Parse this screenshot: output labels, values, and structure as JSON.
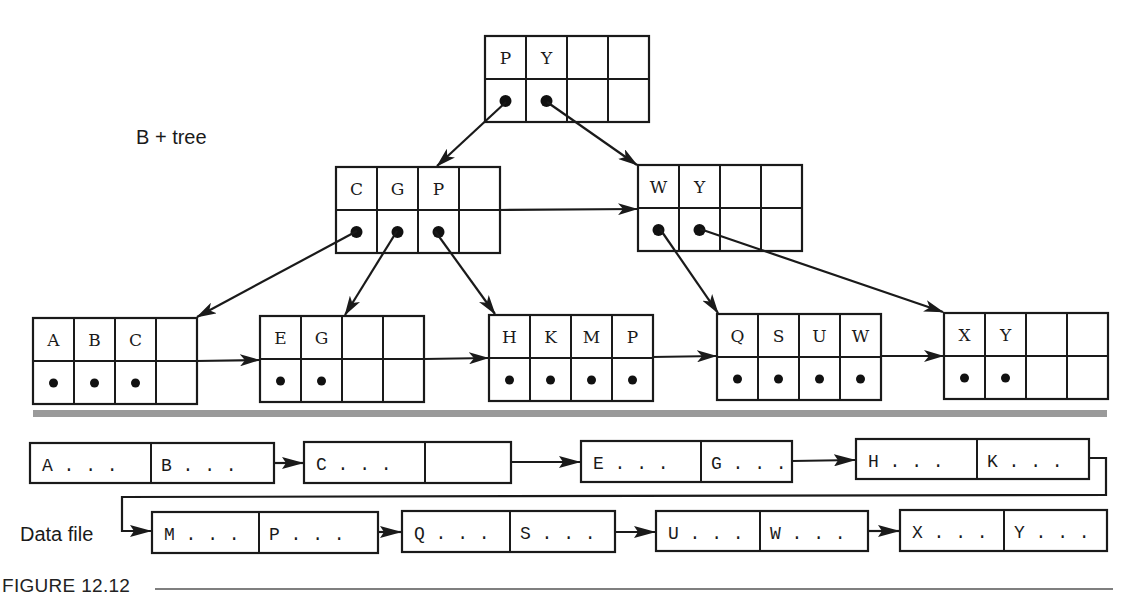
{
  "title_label": "B + tree",
  "data_file_label": "Data file",
  "caption": "FIGURE 12.12",
  "colors": {
    "ink": "#1a1a1a",
    "separator": "#9a9a9a",
    "background": "#ffffff"
  },
  "tree": {
    "order_slots": 4,
    "root": {
      "id": "root",
      "keys": [
        "P",
        "Y",
        "",
        ""
      ],
      "pointers": [
        true,
        true,
        false,
        false
      ]
    },
    "internal": [
      {
        "id": "int-cgp",
        "keys": [
          "C",
          "G",
          "P",
          ""
        ],
        "pointers": [
          true,
          true,
          true,
          false
        ]
      },
      {
        "id": "int-wy",
        "keys": [
          "W",
          "Y",
          "",
          ""
        ],
        "pointers": [
          true,
          true,
          false,
          false
        ]
      }
    ],
    "leaves": [
      {
        "id": "leaf-abc",
        "keys": [
          "A",
          "B",
          "C",
          ""
        ],
        "pointers": [
          true,
          true,
          true,
          false
        ]
      },
      {
        "id": "leaf-eg",
        "keys": [
          "E",
          "G",
          "",
          ""
        ],
        "pointers": [
          true,
          true,
          false,
          false
        ]
      },
      {
        "id": "leaf-hkmp",
        "keys": [
          "H",
          "K",
          "M",
          "P"
        ],
        "pointers": [
          true,
          true,
          true,
          true
        ]
      },
      {
        "id": "leaf-qsuw",
        "keys": [
          "Q",
          "S",
          "U",
          "W"
        ],
        "pointers": [
          true,
          true,
          true,
          true
        ]
      },
      {
        "id": "leaf-xy",
        "keys": [
          "X",
          "Y",
          "",
          ""
        ],
        "pointers": [
          true,
          true,
          false,
          false
        ]
      }
    ],
    "edges": [
      {
        "from": "root.P",
        "to": "int-cgp"
      },
      {
        "from": "root.Y",
        "to": "int-wy"
      },
      {
        "from": "int-cgp",
        "to": "int-wy",
        "type": "sibling"
      },
      {
        "from": "int-cgp.C",
        "to": "leaf-abc"
      },
      {
        "from": "int-cgp.G",
        "to": "leaf-eg"
      },
      {
        "from": "int-cgp.P",
        "to": "leaf-hkmp"
      },
      {
        "from": "int-wy.W",
        "to": "leaf-qsuw"
      },
      {
        "from": "int-wy.Y",
        "to": "leaf-xy"
      },
      {
        "from": "leaf-abc",
        "to": "leaf-eg",
        "type": "sibling"
      },
      {
        "from": "leaf-eg",
        "to": "leaf-hkmp",
        "type": "sibling"
      },
      {
        "from": "leaf-hkmp",
        "to": "leaf-qsuw",
        "type": "sibling"
      },
      {
        "from": "leaf-qsuw",
        "to": "leaf-xy",
        "type": "sibling"
      }
    ]
  },
  "data_file": {
    "blocks": [
      {
        "records": [
          "A . . .",
          "B . . ."
        ]
      },
      {
        "records": [
          "C . . .",
          ""
        ]
      },
      {
        "records": [
          "E . . .",
          "G . . ."
        ]
      },
      {
        "records": [
          "H . . .",
          "K . . ."
        ]
      },
      {
        "records": [
          "M . . .",
          "P . . ."
        ]
      },
      {
        "records": [
          "Q . . .",
          "S . . ."
        ]
      },
      {
        "records": [
          "U . . .",
          "W . . ."
        ]
      },
      {
        "records": [
          "X . . .",
          "Y . . ."
        ]
      }
    ]
  }
}
